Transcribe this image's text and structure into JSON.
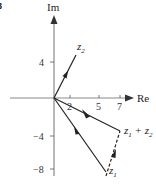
{
  "figure": {
    "corner_label": "8",
    "axes": {
      "x_label": "Re",
      "y_label": "Im",
      "x_ticks": [
        "2",
        "5",
        "7"
      ],
      "y_ticks": [
        "4",
        "−4",
        "−8"
      ]
    },
    "vectors": [
      {
        "name": "z2",
        "label_main": "z",
        "label_sub": "2",
        "style": "solid"
      },
      {
        "name": "z1",
        "label_main": "z",
        "label_sub": "1",
        "style": "solid"
      },
      {
        "name": "z1+z2",
        "label_main": "z",
        "label_sub": "1",
        "label_plus": " + z",
        "label_sub2": "2",
        "style": "solid"
      },
      {
        "name": "z2-translated",
        "style": "dashed"
      }
    ],
    "colors": {
      "axis": "#8a8a8a",
      "vector": "#222222",
      "background": "#ffffff"
    }
  }
}
